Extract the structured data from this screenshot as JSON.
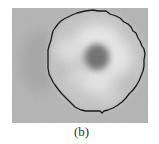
{
  "figure": {
    "panel_label": "(b)",
    "image_description": "Grayscale micrograph of a single cell with a dark central nucleus and a black segmentation contour around the cell boundary",
    "colors": {
      "background": "#b4b4b4",
      "cytoplasm_light": "#e6e6e6",
      "cytoplasm_mid": "#c8c8c8",
      "nucleus": "#6e6e6e",
      "contour": "#1a1a1a",
      "caption_text": "#333333"
    }
  }
}
